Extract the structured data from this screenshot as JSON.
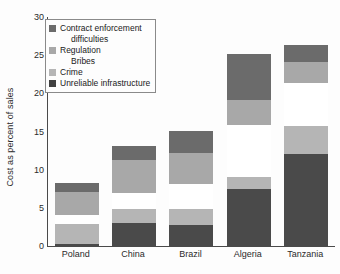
{
  "chart_data": {
    "type": "bar",
    "subtype": "stacked-bar",
    "title": "",
    "xlabel": "",
    "ylabel": "Cost as percent of sales",
    "ylim": [
      0,
      30
    ],
    "yticks": [
      0,
      5,
      10,
      15,
      20,
      25,
      30
    ],
    "ytick_labels": [
      "0",
      "5",
      "10",
      "15",
      "20",
      "25",
      "30"
    ],
    "grid": false,
    "legend_position": "upper-left-inside",
    "categories": [
      "Poland",
      "China",
      "Brazil",
      "Algeria",
      "Tanzania"
    ],
    "series": [
      {
        "name": "Unreliable infrastructure",
        "color": "#4a4a4a",
        "values": [
          0.3,
          3.0,
          2.7,
          7.5,
          12.1
        ]
      },
      {
        "name": "Crime",
        "color": "#b5b5b5",
        "values": [
          2.6,
          1.8,
          2.1,
          1.6,
          3.6
        ]
      },
      {
        "name": "Bribes",
        "color": "#ffffff",
        "values": [
          1.2,
          2.2,
          3.3,
          6.7,
          5.7
        ]
      },
      {
        "name": "Regulation",
        "color": "#a8a8a8",
        "values": [
          3.0,
          4.3,
          4.1,
          3.3,
          2.7
        ]
      },
      {
        "name": "Contract enforcement difficulties",
        "color": "#6b6b6b",
        "values": [
          1.2,
          1.8,
          2.9,
          6.1,
          2.2
        ]
      }
    ],
    "totals": [
      8.3,
      13.1,
      15.1,
      25.2,
      26.3
    ]
  },
  "legend": {
    "entries": [
      {
        "label": "Contract enforcement",
        "label2": "difficulties",
        "color": "#6b6b6b",
        "swatch": true
      },
      {
        "label": "Regulation",
        "label2": "Bribes",
        "color": "#a8a8a8",
        "swatch": true
      },
      {
        "label": "Crime",
        "color": "#b5b5b5",
        "swatch": true
      },
      {
        "label": "Unreliable infrastructure",
        "color": "#404040",
        "swatch": true
      }
    ]
  },
  "colors": {
    "axis": "#4a4a4a",
    "text": "#2b2b2b",
    "background": "#fdfdfd",
    "legend_border": "#8a8a8a"
  }
}
